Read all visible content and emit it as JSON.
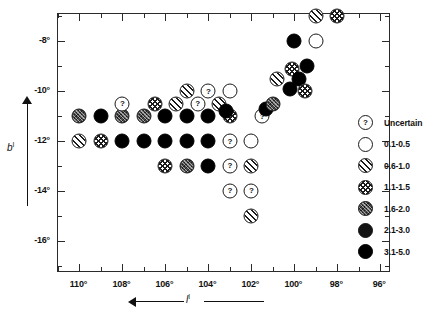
{
  "chart_data": {
    "type": "scatter",
    "title": "",
    "xlabel": "l^I",
    "ylabel": "b^I",
    "xlim": [
      111,
      95.5
    ],
    "ylim": [
      -17.3,
      -6.9
    ],
    "x_axis_reversed": true,
    "grid": false,
    "legend_position": "right-inside",
    "xticks": [
      "110°",
      "108°",
      "106°",
      "104°",
      "102°",
      "100°",
      "98°",
      "96°"
    ],
    "xtick_values": [
      110,
      108,
      106,
      104,
      102,
      100,
      98,
      96
    ],
    "yticks": [
      "-8°",
      "-10°",
      "-12°",
      "-14°",
      "-16°"
    ],
    "ytick_values": [
      -8,
      -10,
      -12,
      -14,
      -16
    ],
    "minor_tick_step": 1,
    "legend": [
      {
        "key": "uncertain",
        "label": "Uncertain",
        "swatch": "m-uncertain"
      },
      {
        "key": "0.1-0.5",
        "label": "0.1-0.5",
        "swatch": "m-open"
      },
      {
        "key": "0.6-1.0",
        "label": "0.6-1.0",
        "swatch": "m-hatch"
      },
      {
        "key": "1.1-1.5",
        "label": "1.1-1.5",
        "swatch": "m-cross"
      },
      {
        "key": "1.6-2.0",
        "label": "1.6-2.0",
        "swatch": "m-grey"
      },
      {
        "key": "2.1-3.0",
        "label": "2.1-3.0",
        "swatch": "m-dark"
      },
      {
        "key": "3.1-5.0",
        "label": "3.1-5.0",
        "swatch": "m-black"
      }
    ],
    "points": [
      {
        "x": 110,
        "y": -11,
        "cat": "1.6-2.0"
      },
      {
        "x": 109,
        "y": -11,
        "cat": "3.1-5.0"
      },
      {
        "x": 108,
        "y": -11,
        "cat": "1.6-2.0"
      },
      {
        "x": 107,
        "y": -11,
        "cat": "1.6-2.0"
      },
      {
        "x": 106,
        "y": -11,
        "cat": "3.1-5.0"
      },
      {
        "x": 105,
        "y": -11,
        "cat": "3.1-5.0"
      },
      {
        "x": 104,
        "y": -11,
        "cat": "3.1-5.0"
      },
      {
        "x": 103,
        "y": -11,
        "cat": "1.1-1.5"
      },
      {
        "x": 108,
        "y": -10.5,
        "cat": "uncertain"
      },
      {
        "x": 106.5,
        "y": -10.5,
        "cat": "1.1-1.5"
      },
      {
        "x": 105.5,
        "y": -10.5,
        "cat": "0.6-1.0"
      },
      {
        "x": 104.5,
        "y": -10.5,
        "cat": "uncertain"
      },
      {
        "x": 103.5,
        "y": -10.5,
        "cat": "0.6-1.0"
      },
      {
        "x": 103.2,
        "y": -10.8,
        "cat": "3.1-5.0"
      },
      {
        "x": 105,
        "y": -10,
        "cat": "0.6-1.0"
      },
      {
        "x": 104,
        "y": -10,
        "cat": "uncertain"
      },
      {
        "x": 103,
        "y": -10,
        "cat": "0.1-0.5"
      },
      {
        "x": 110,
        "y": -12,
        "cat": "0.6-1.0"
      },
      {
        "x": 109,
        "y": -12,
        "cat": "1.1-1.5"
      },
      {
        "x": 108,
        "y": -12,
        "cat": "3.1-5.0"
      },
      {
        "x": 107,
        "y": -12,
        "cat": "3.1-5.0"
      },
      {
        "x": 106,
        "y": -12,
        "cat": "3.1-5.0"
      },
      {
        "x": 105,
        "y": -12,
        "cat": "3.1-5.0"
      },
      {
        "x": 104,
        "y": -12,
        "cat": "3.1-5.0"
      },
      {
        "x": 103,
        "y": -12,
        "cat": "uncertain"
      },
      {
        "x": 102,
        "y": -12,
        "cat": "0.1-0.5"
      },
      {
        "x": 106,
        "y": -13,
        "cat": "1.1-1.5"
      },
      {
        "x": 105,
        "y": -13,
        "cat": "1.6-2.0"
      },
      {
        "x": 104,
        "y": -13,
        "cat": "3.1-5.0"
      },
      {
        "x": 103,
        "y": -13,
        "cat": "uncertain"
      },
      {
        "x": 102,
        "y": -13,
        "cat": "0.6-1.0"
      },
      {
        "x": 103,
        "y": -14,
        "cat": "uncertain"
      },
      {
        "x": 102,
        "y": -14,
        "cat": "uncertain"
      },
      {
        "x": 102,
        "y": -15,
        "cat": "0.6-1.0"
      },
      {
        "x": 101.5,
        "y": -11,
        "cat": "uncertain"
      },
      {
        "x": 101.3,
        "y": -10.7,
        "cat": "3.1-5.0"
      },
      {
        "x": 101,
        "y": -10.5,
        "cat": "1.6-2.0"
      },
      {
        "x": 100.8,
        "y": -9.5,
        "cat": "0.6-1.0"
      },
      {
        "x": 100.2,
        "y": -9.9,
        "cat": "3.1-5.0"
      },
      {
        "x": 100.1,
        "y": -9.1,
        "cat": "1.1-1.5"
      },
      {
        "x": 99.8,
        "y": -9.5,
        "cat": "3.1-5.0"
      },
      {
        "x": 99.5,
        "y": -10,
        "cat": "1.1-1.5"
      },
      {
        "x": 99.4,
        "y": -9,
        "cat": "3.1-5.0"
      },
      {
        "x": 100,
        "y": -8,
        "cat": "3.1-5.0"
      },
      {
        "x": 99,
        "y": -8,
        "cat": "0.1-0.5"
      },
      {
        "x": 99,
        "y": -7,
        "cat": "0.6-1.0"
      },
      {
        "x": 98,
        "y": -7,
        "cat": "1.1-1.5"
      }
    ]
  }
}
